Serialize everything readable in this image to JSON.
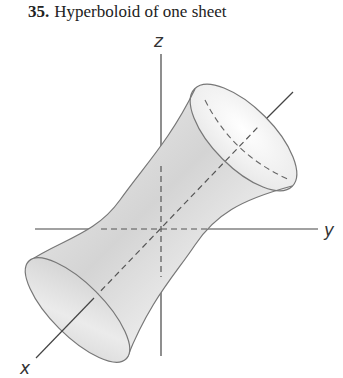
{
  "exercise": {
    "number": "35.",
    "title": "Hyperboloid of one sheet"
  },
  "figure": {
    "axes": {
      "x_label": "x",
      "y_label": "y",
      "z_label": "z"
    },
    "surface": "hyperboloid of one sheet",
    "colors": {
      "axis": "#444444",
      "surface_fill_light": "#fafafa",
      "surface_fill_dark": "#bdbdbd",
      "outline": "#777777"
    }
  }
}
